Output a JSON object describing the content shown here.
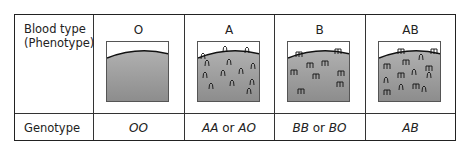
{
  "table": {
    "row_labels": {
      "phenotype_line1": "Blood type",
      "phenotype_line2": "(Phenotype)",
      "genotype": "Genotype"
    },
    "columns": [
      {
        "blood_type": "O",
        "genotype_a": "OO",
        "genotype_or": "",
        "genotype_b": "",
        "antigens": "none"
      },
      {
        "blood_type": "A",
        "genotype_a": "AA",
        "genotype_or": " or ",
        "genotype_b": "AO",
        "antigens": "A"
      },
      {
        "blood_type": "B",
        "genotype_a": "BB",
        "genotype_or": " or ",
        "genotype_b": "BO",
        "antigens": "B"
      },
      {
        "blood_type": "AB",
        "genotype_a": "AB",
        "genotype_or": "",
        "genotype_b": "",
        "antigens": "A and B"
      }
    ]
  },
  "colors": {
    "border": "#222222",
    "cell_fill_top": "#a8a8a8",
    "cell_fill_bottom": "#8e8e8e"
  }
}
